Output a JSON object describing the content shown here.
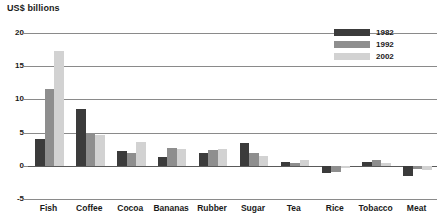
{
  "chart_data": {
    "type": "bar",
    "title": "US$ billions",
    "xlabel": "",
    "ylabel": "US$ billions",
    "ylim": [
      -5,
      20
    ],
    "yticks": [
      20,
      15,
      10,
      5,
      0,
      -5
    ],
    "grid": true,
    "legend_position": "top-right",
    "categories": [
      "Fish",
      "Coffee",
      "Cocoa",
      "Bananas",
      "Rubber",
      "Sugar",
      "Tea",
      "Rice",
      "Tobacco",
      "Meat"
    ],
    "series": [
      {
        "name": "1982",
        "color": "#3b3b3b",
        "values": [
          4.0,
          8.5,
          2.2,
          1.3,
          2.0,
          3.5,
          0.6,
          -1.1,
          0.5,
          -1.5
        ]
      },
      {
        "name": "1992",
        "color": "#8e8e8e",
        "values": [
          11.5,
          5.0,
          1.9,
          2.7,
          2.4,
          2.0,
          0.4,
          -0.9,
          0.9,
          -0.5
        ]
      },
      {
        "name": "2002",
        "color": "#d2d2d2",
        "values": [
          17.3,
          4.7,
          3.6,
          2.6,
          2.5,
          1.5,
          0.8,
          -0.3,
          0.4,
          -0.6
        ]
      }
    ]
  },
  "legend": {
    "items": [
      {
        "label": "1982",
        "color": "#3b3b3b"
      },
      {
        "label": "1992",
        "color": "#8e8e8e"
      },
      {
        "label": "2002",
        "color": "#d2d2d2"
      }
    ]
  },
  "axis": {
    "y_tick_labels": [
      "20",
      "15",
      "10",
      "5",
      "0",
      "-5"
    ]
  }
}
